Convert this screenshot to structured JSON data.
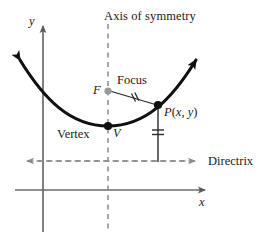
{
  "figure": {
    "type": "geometry-diagram",
    "width": 273,
    "height": 236,
    "background_color": "#ffffff"
  },
  "labels": {
    "axis_of_symmetry": "Axis of symmetry",
    "focus": "Focus",
    "focus_point": "F",
    "vertex": "Vertex",
    "vertex_point": "V",
    "directrix": "Directrix",
    "point_p": "P(x, y)",
    "point_p_name": "P",
    "point_p_open": "(",
    "point_p_x": "x",
    "point_p_comma": ", ",
    "point_p_y": "y",
    "point_p_close": ")",
    "y_axis": "y",
    "x_axis": "x"
  },
  "colors": {
    "curve": "#101010",
    "axis": "#6b6b6b",
    "dashed": "#8a8a8a",
    "focus_dot": "#9a9a9a",
    "vertex_dot": "#101010",
    "point_dot": "#101010",
    "text": "#1a1a1a"
  },
  "geometry": {
    "y_axis_x": 43,
    "x_axis_y": 190,
    "axis_of_symmetry_x": 108,
    "directrix_y": 161,
    "vertex": {
      "x": 108,
      "y": 126
    },
    "focus": {
      "x": 108,
      "y": 91
    },
    "point_p": {
      "x": 158,
      "y": 105
    },
    "foot_of_perpendicular": {
      "x": 158,
      "y": 161
    },
    "parabola_left_tip": {
      "x": 14,
      "y": 53
    },
    "parabola_right_tip": {
      "x": 202,
      "y": 53
    }
  },
  "annotations": {
    "equal_marks": [
      {
        "name": "focal-radius-tick",
        "segment": "F-to-P",
        "count": 2
      },
      {
        "name": "directrix-distance-tick",
        "segment": "P-to-directrix",
        "count": 2
      }
    ]
  }
}
